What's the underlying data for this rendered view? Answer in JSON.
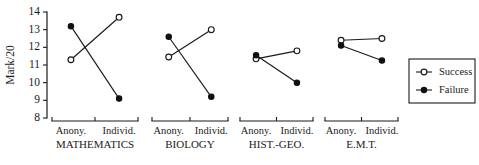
{
  "chart_data": {
    "type": "line",
    "title": "",
    "xlabel": "",
    "ylabel": "Mark/20",
    "ylim": [
      8,
      14
    ],
    "ytick_labels": [
      "8",
      "9",
      "10",
      "11",
      "12",
      "13",
      "14"
    ],
    "ytick_values": [
      8,
      9,
      10,
      11,
      12,
      13,
      14
    ],
    "grid": false,
    "legend_position": "right",
    "categories": [
      "Anony.",
      "Individ."
    ],
    "panels": [
      {
        "name": "MATHEMATICS",
        "x_labels": [
          "Anony.",
          "Individ."
        ],
        "series": [
          {
            "name": "Success",
            "values": [
              11.3,
              13.7
            ]
          },
          {
            "name": "Failure",
            "values": [
              13.2,
              9.1
            ]
          }
        ]
      },
      {
        "name": "BIOLOGY",
        "x_labels": [
          "Anony.",
          "Individ."
        ],
        "series": [
          {
            "name": "Success",
            "values": [
              11.45,
              13.0
            ]
          },
          {
            "name": "Failure",
            "values": [
              12.6,
              9.2
            ]
          }
        ]
      },
      {
        "name": "HIST.-GEO.",
        "x_labels": [
          "Anony.",
          "Individ."
        ],
        "series": [
          {
            "name": "Success",
            "values": [
              11.35,
              11.8
            ]
          },
          {
            "name": "Failure",
            "values": [
              11.55,
              10.0
            ]
          }
        ]
      },
      {
        "name": "E.M.T.",
        "x_labels": [
          "Anony.",
          "Individ."
        ],
        "series": [
          {
            "name": "Success",
            "values": [
              12.4,
              12.5
            ]
          },
          {
            "name": "Failure",
            "values": [
              12.1,
              11.25
            ]
          }
        ]
      }
    ],
    "legend": [
      {
        "label": "Success",
        "marker": "open-circle"
      },
      {
        "label": "Failure",
        "marker": "filled-circle"
      }
    ],
    "colors": {
      "ink": "#1a1a1a",
      "success_fill": "#ffffff",
      "failure_fill": "#101010",
      "background": "#ffffff"
    }
  }
}
